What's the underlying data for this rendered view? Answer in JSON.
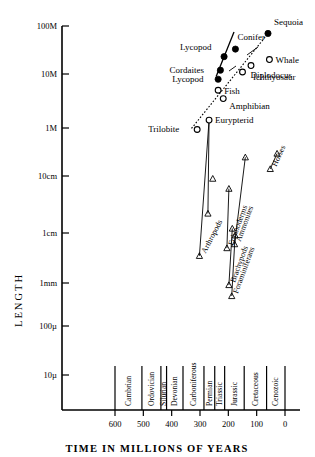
{
  "chart_data": {
    "type": "scatter",
    "title": "",
    "xlabel": "TIME IN MILLIONS OF YEARS",
    "ylabel": "LENGTH",
    "xlim": [
      650,
      -20
    ],
    "x_ticks": [
      "600",
      "500",
      "400",
      "300",
      "200",
      "100",
      "0"
    ],
    "x_tick_values": [
      600,
      500,
      400,
      300,
      200,
      100,
      0
    ],
    "y_ticks": [
      "100M",
      "10M",
      "1M",
      "10cm",
      "1cm",
      "1mm",
      "100µ",
      "10µ"
    ],
    "y_tick_values": [
      100000000,
      10000000,
      1000000,
      10,
      1,
      0.1,
      0.01,
      0.001
    ],
    "grid": false,
    "legend": "none",
    "periods": [
      {
        "label": "Cambrian",
        "start": 600,
        "end": 505
      },
      {
        "label": "Ordovician",
        "start": 505,
        "end": 438
      },
      {
        "label": "Silurian",
        "start": 438,
        "end": 418
      },
      {
        "label": "Devonian",
        "start": 418,
        "end": 360
      },
      {
        "label": "Carboniferous",
        "start": 360,
        "end": 286
      },
      {
        "label": "Permian",
        "start": 286,
        "end": 248
      },
      {
        "label": "Triassic",
        "start": 248,
        "end": 213
      },
      {
        "label": "Jurassic",
        "start": 213,
        "end": 144
      },
      {
        "label": "Cretaceous",
        "start": 144,
        "end": 65
      },
      {
        "label": "Cenozoic",
        "start": 65,
        "end": 0
      }
    ],
    "points": [
      {
        "label": "Sequoia",
        "x": 60,
        "y": 70000000,
        "marker": "filled-circle",
        "label_dx": 6,
        "label_dy": -8
      },
      {
        "label": "Conifer",
        "x": 175,
        "y": 33000000,
        "marker": "filled-circle",
        "label_dx": 2,
        "label_dy": -9
      },
      {
        "label": "Lycopod",
        "x": 215,
        "y": 23000000,
        "marker": "filled-circle",
        "label_dx": -44,
        "label_dy": -7
      },
      {
        "label": "Whale",
        "x": 55,
        "y": 20000000,
        "marker": "open-circle",
        "label_dx": 6,
        "label_dy": 3
      },
      {
        "label": "Diplodocus",
        "x": 150,
        "y": 11000000,
        "marker": "open-circle",
        "label_dx": 8,
        "label_dy": 6
      },
      {
        "label": "Ichthyosaur",
        "x": 120,
        "y": 15000000,
        "marker": "open-circle",
        "label_dx": 2,
        "label_dy": 14
      },
      {
        "label": "Cordaites",
        "x": 228,
        "y": 12000000,
        "marker": "filled-circle",
        "label_dx": -51,
        "label_dy": 3
      },
      {
        "label": "Lycopod",
        "x": 236,
        "y": 8000000,
        "marker": "filled-circle",
        "label_dx": -46,
        "label_dy": 3
      },
      {
        "label": "Fish",
        "x": 236,
        "y": 5000000,
        "marker": "open-circle",
        "label_dx": 6,
        "label_dy": 4
      },
      {
        "label": "Amphibian",
        "x": 218,
        "y": 3500000,
        "marker": "open-circle",
        "label_dx": 6,
        "label_dy": 10
      },
      {
        "label": "Eurypterid",
        "x": 268,
        "y": 1400000,
        "marker": "open-circle",
        "label_dx": 6,
        "label_dy": 3
      },
      {
        "label": "Trilobite",
        "x": 310,
        "y": 700000,
        "marker": "open-circle",
        "label_dx": -49,
        "label_dy": 3
      }
    ],
    "trend_lines": [
      {
        "name": "plants-solid",
        "style": "solid",
        "x1": 243,
        "y1": 9000000,
        "x2": 180,
        "y2": 75000000
      },
      {
        "name": "animals-dotted",
        "style": "dotted",
        "x1": 330,
        "y1": 900000,
        "x2": 58,
        "y2": 72000000
      }
    ],
    "groups": [
      {
        "label": "Arthropods",
        "rotation": -62,
        "triangles": [
          [
            302,
            0.35
          ],
          [
            255,
            9
          ]
        ],
        "line": [
          [
            302,
            0.35
          ],
          [
            268,
            1400000
          ]
        ]
      },
      {
        "label": "Arthropods-2",
        "rotation": -62,
        "triangles": [
          [
            272,
            2.2
          ]
        ],
        "line": [
          [
            272,
            2.2
          ],
          [
            268,
            1400000
          ]
        ]
      },
      {
        "label": "Echinoderms",
        "rotation": -70,
        "triangles": [
          [
            205,
            0.5
          ],
          [
            198,
            6
          ]
        ],
        "line": [
          [
            205,
            0.5
          ],
          [
            198,
            6
          ]
        ]
      },
      {
        "label": "Brachypods",
        "rotation": -70,
        "triangles": [
          [
            198,
            0.09
          ],
          [
            186,
            1.2
          ]
        ],
        "line": [
          [
            198,
            0.09
          ],
          [
            186,
            1.2
          ]
        ]
      },
      {
        "label": "Foraminiferans",
        "rotation": -70,
        "triangles": [
          [
            188,
            0.05
          ],
          [
            176,
            0.9
          ]
        ],
        "line": [
          [
            188,
            0.05
          ],
          [
            176,
            0.9
          ]
        ]
      },
      {
        "label": "Ammonites",
        "rotation": -70,
        "triangles": [
          [
            178,
            0.6
          ],
          [
            140,
            900
          ]
        ],
        "line": [
          [
            178,
            0.6
          ],
          [
            140,
            900
          ]
        ]
      },
      {
        "label": "Horses",
        "rotation": -65,
        "triangles": [
          [
            52,
            55
          ],
          [
            28,
            2200
          ]
        ],
        "line": [
          [
            52,
            55
          ],
          [
            28,
            2200
          ]
        ]
      }
    ]
  }
}
